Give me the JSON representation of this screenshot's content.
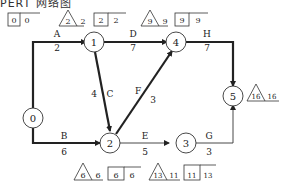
{
  "header": {
    "clipped_text": "PERT 网络图"
  },
  "nodes": [
    {
      "id": "0",
      "label": "0"
    },
    {
      "id": "1",
      "label": "1"
    },
    {
      "id": "2",
      "label": "2"
    },
    {
      "id": "3",
      "label": "3"
    },
    {
      "id": "4",
      "label": "4"
    },
    {
      "id": "5",
      "label": "5"
    }
  ],
  "activities": [
    {
      "name": "A",
      "from": "0",
      "to": "1",
      "duration": "2",
      "critical": true
    },
    {
      "name": "B",
      "from": "0",
      "to": "2",
      "duration": "6",
      "critical": true
    },
    {
      "name": "C",
      "from": "1",
      "to": "2",
      "duration": "4",
      "critical": true
    },
    {
      "name": "D",
      "from": "1",
      "to": "4",
      "duration": "7",
      "critical": true
    },
    {
      "name": "E",
      "from": "2",
      "to": "3",
      "duration": "5",
      "critical": false
    },
    {
      "name": "F",
      "from": "2",
      "to": "4",
      "duration": "3",
      "critical": true
    },
    {
      "name": "G",
      "from": "3",
      "to": "5",
      "duration": "3",
      "critical": false
    },
    {
      "name": "H",
      "from": "4",
      "to": "5",
      "duration": "7",
      "critical": true
    }
  ],
  "annotations": {
    "node0": {
      "box_left": "0",
      "box_right": "0"
    },
    "node1": {
      "tri": "2",
      "tri_right": "2",
      "box_left": "2",
      "box_right": "2"
    },
    "node4": {
      "tri": "9",
      "tri_right": "9",
      "box_left": "9",
      "box_right": "9"
    },
    "node2": {
      "tri": "6",
      "tri_right": "6",
      "box_left": "6",
      "box_right": "6"
    },
    "node3": {
      "tri": "13",
      "tri_right": "11",
      "box_left": "11",
      "box_right": "13"
    },
    "node5": {
      "tri": "16",
      "tri_right": "16"
    }
  },
  "colors": {
    "line": "#222222",
    "background": "#ffffff"
  }
}
